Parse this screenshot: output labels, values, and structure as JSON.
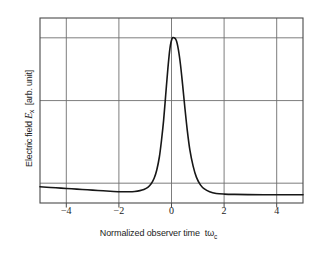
{
  "chart_data": {
    "type": "line",
    "title": "",
    "subtitle": "",
    "xlabel": "Normalized observer time",
    "xlabel_symbol": "tω",
    "xlabel_symbol_sub": "c",
    "ylabel": "Electric field",
    "ylabel_symbol": "E",
    "ylabel_symbol_sub": "x",
    "ylabel_units": "[arb. unit]",
    "xlim": [
      -5,
      5
    ],
    "ylim": [
      0,
      1.12
    ],
    "xticks": [
      -4,
      -2,
      0,
      2,
      4
    ],
    "xtick_labels": [
      "−4",
      "−2",
      "0",
      "2",
      "4"
    ],
    "yticks": [],
    "ytick_labels": [],
    "grid": true,
    "grid_x": [
      -4,
      -2,
      0,
      2,
      4
    ],
    "grid_y": [
      0.12,
      0.62,
      1.0
    ],
    "legend": "none",
    "series": [
      {
        "name": "Ex",
        "peak_x": 0.1,
        "peak_y": 1.0,
        "baseline_y": 0.06,
        "fwhm": 0.62,
        "x": [
          -5.0,
          -4.6,
          -4.2,
          -3.8,
          -3.4,
          -3.0,
          -2.6,
          -2.2,
          -1.9,
          -1.6,
          -1.4,
          -1.2,
          -1.05,
          -0.9,
          -0.78,
          -0.66,
          -0.56,
          -0.46,
          -0.38,
          -0.3,
          -0.22,
          -0.14,
          -0.06,
          0.02,
          0.1,
          0.18,
          0.26,
          0.34,
          0.42,
          0.5,
          0.6,
          0.7,
          0.82,
          0.95,
          1.1,
          1.25,
          1.45,
          1.7,
          2.0,
          2.4,
          2.9,
          3.5,
          4.2,
          5.0
        ],
        "y": [
          0.098,
          0.094,
          0.09,
          0.086,
          0.082,
          0.078,
          0.074,
          0.07,
          0.068,
          0.068,
          0.07,
          0.075,
          0.082,
          0.095,
          0.115,
          0.15,
          0.2,
          0.28,
          0.38,
          0.5,
          0.655,
          0.81,
          0.935,
          0.995,
          1.0,
          0.985,
          0.93,
          0.84,
          0.72,
          0.59,
          0.44,
          0.32,
          0.225,
          0.155,
          0.11,
          0.085,
          0.068,
          0.058,
          0.054,
          0.052,
          0.051,
          0.05,
          0.05,
          0.05
        ]
      }
    ],
    "colors": {
      "curve": "#171717",
      "frame": "#4a4a4a",
      "grid": "#6e6e6e",
      "background": "#ffffff"
    }
  },
  "axes": {
    "plot_left_px": 40,
    "plot_right_px": 303,
    "plot_top_px": 18,
    "plot_bottom_px": 203
  },
  "artifacts": {
    "corner_mark": "↘"
  }
}
